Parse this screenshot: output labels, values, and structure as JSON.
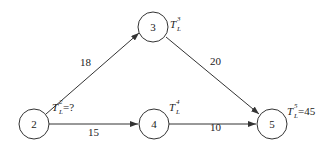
{
  "diagram": {
    "type": "activity-network",
    "nodes": [
      {
        "id": "2",
        "label": "2",
        "annotation": {
          "symbol": "T",
          "sub": "L",
          "sup": "2",
          "value": "=?"
        }
      },
      {
        "id": "3",
        "label": "3",
        "annotation": {
          "symbol": "T",
          "sub": "L",
          "sup": "3",
          "value": ""
        }
      },
      {
        "id": "4",
        "label": "4",
        "annotation": {
          "symbol": "T",
          "sub": "L",
          "sup": "4",
          "value": ""
        }
      },
      {
        "id": "5",
        "label": "5",
        "annotation": {
          "symbol": "T",
          "sub": "L",
          "sup": "5",
          "value": "=45"
        }
      }
    ],
    "edges": [
      {
        "from": "2",
        "to": "3",
        "label": "18"
      },
      {
        "from": "2",
        "to": "4",
        "label": "15"
      },
      {
        "from": "3",
        "to": "5",
        "label": "20"
      },
      {
        "from": "4",
        "to": "5",
        "label": "10"
      }
    ],
    "colors": {
      "stroke": "#333333",
      "text": "#222222",
      "background": "#ffffff"
    }
  }
}
